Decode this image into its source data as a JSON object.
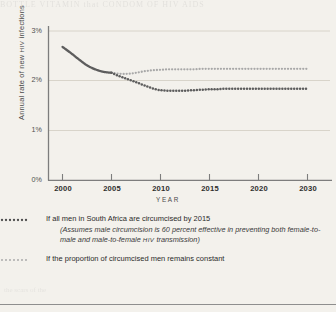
{
  "figure": {
    "ylabel_pre": "Annual rate of new ",
    "ylabel_sc": "HIV",
    "ylabel_post": " infections",
    "xlabel": "YEAR"
  },
  "legend": [
    {
      "swatch": "dotted-dark-line",
      "text": "If all men in South Africa are circumcised by 2015",
      "sub_pre": "(Assumes male circumcision is 60 percent effective in preventing both female-to-male and male-to-female ",
      "sub_sc": "HIV",
      "sub_post": " transmission)"
    },
    {
      "swatch": "dotted-light-line",
      "text": "If  the proportion of circumcised men remains constant"
    }
  ],
  "bleed_text": "BOTTLE  VITAMIN  that   CONDOM  OF  HIV  AIDS",
  "bleed_text_2": "the      scars   of  the",
  "colors": {
    "series_circumcision": "#5d5d5d",
    "series_constant": "#a8a8a8",
    "axis": "#7d7d7d",
    "gridline": "#d6d2c9",
    "paper": "#f3f1ec",
    "text": "#2b2b2b"
  },
  "chart_data": {
    "type": "line",
    "title": "",
    "xlabel": "YEAR",
    "ylabel": "Annual rate of new HIV infections",
    "xlim": [
      2000,
      2030
    ],
    "ylim": [
      0,
      3
    ],
    "xticks": [
      2000,
      2005,
      2010,
      2015,
      2020,
      2030
    ],
    "xticklabels": [
      "2000",
      "2005",
      "2010",
      "2015",
      "2020",
      "2030"
    ],
    "yticks": [
      0,
      1,
      2,
      3
    ],
    "yticklabels": [
      "0%",
      "1%",
      "2%",
      "3%"
    ],
    "y_unit": "percent",
    "grid": "horizontal",
    "legend_position": "below",
    "x": [
      2000,
      2001,
      2002,
      2003,
      2004,
      2005,
      2006,
      2007,
      2008,
      2009,
      2010,
      2011,
      2012,
      2013,
      2014,
      2015,
      2016,
      2017,
      2018,
      2019,
      2020,
      2021,
      2022,
      2023,
      2024,
      2025,
      2026,
      2027,
      2028,
      2029,
      2030
    ],
    "series": [
      {
        "name": "Historical / baseline (solid, shared)",
        "style": "solid",
        "color": "#5d5d5d",
        "x": [
          2000,
          2001,
          2002,
          2003,
          2004,
          2005,
          2006
        ],
        "values": [
          2.68,
          2.56,
          2.43,
          2.31,
          2.23,
          2.18,
          2.16
        ]
      },
      {
        "name": "If all men in South Africa are circumcised by 2015",
        "style": "dotted-dark",
        "color": "#5d5d5d",
        "x": [
          2006,
          2007,
          2008,
          2009,
          2010,
          2011,
          2012,
          2013,
          2014,
          2015,
          2016,
          2017,
          2018,
          2019,
          2020,
          2021,
          2022,
          2023,
          2024,
          2025,
          2026,
          2027,
          2028,
          2029,
          2030
        ],
        "values": [
          2.16,
          2.09,
          2.03,
          1.97,
          1.91,
          1.85,
          1.81,
          1.8,
          1.8,
          1.8,
          1.81,
          1.82,
          1.83,
          1.83,
          1.84,
          1.84,
          1.84,
          1.84,
          1.84,
          1.84,
          1.84,
          1.84,
          1.84,
          1.84,
          1.84
        ]
      },
      {
        "name": "If the proportion of circumcised men remains constant",
        "style": "dotted-light",
        "color": "#a8a8a8",
        "x": [
          2006,
          2007,
          2008,
          2009,
          2010,
          2011,
          2012,
          2013,
          2014,
          2015,
          2016,
          2017,
          2018,
          2019,
          2020,
          2021,
          2022,
          2023,
          2024,
          2025,
          2026,
          2027,
          2028,
          2029,
          2030
        ],
        "values": [
          2.16,
          2.14,
          2.14,
          2.16,
          2.19,
          2.21,
          2.22,
          2.23,
          2.23,
          2.23,
          2.23,
          2.24,
          2.24,
          2.24,
          2.24,
          2.24,
          2.24,
          2.24,
          2.24,
          2.24,
          2.24,
          2.24,
          2.24,
          2.24,
          2.24
        ]
      }
    ],
    "annotations": [
      "Assumes male circumcision is 60 percent effective in preventing both female-to-male and male-to-female HIV transmission"
    ]
  }
}
